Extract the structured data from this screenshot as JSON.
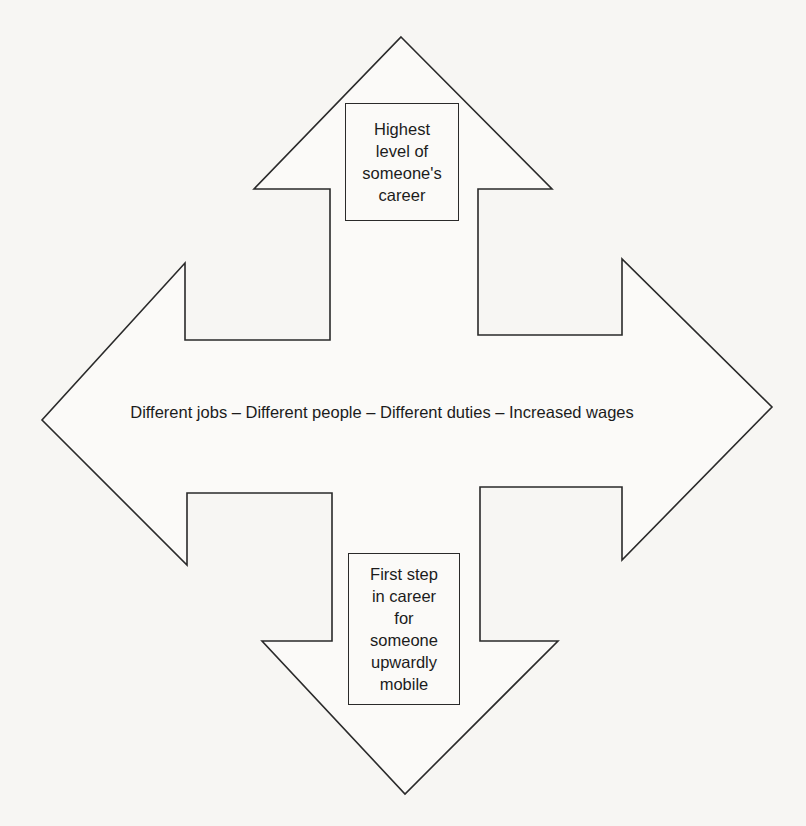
{
  "diagram": {
    "type": "four-way-arrow",
    "colors": {
      "background": "#f7f6f3",
      "stroke": "#2a2a2a",
      "text": "#1c1c1c"
    },
    "arrows": {
      "up": {
        "label": "Highest\nlevel of\nsomeone's\ncareer"
      },
      "down": {
        "label": "First step\nin career\nfor\nsomeone\nupwardly\nmobile"
      },
      "horizontal": {
        "label": "Different jobs – Different people – Different duties – Increased wages"
      }
    }
  }
}
